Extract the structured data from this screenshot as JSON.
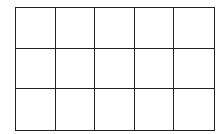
{
  "diagram": {
    "type": "grid",
    "rows": 3,
    "columns": 5,
    "line_color": "#222222",
    "fill_color": "#ffffff",
    "cells": [
      [
        "",
        "",
        "",
        "",
        ""
      ],
      [
        "",
        "",
        "",
        "",
        ""
      ],
      [
        "",
        "",
        "",
        "",
        ""
      ]
    ]
  }
}
